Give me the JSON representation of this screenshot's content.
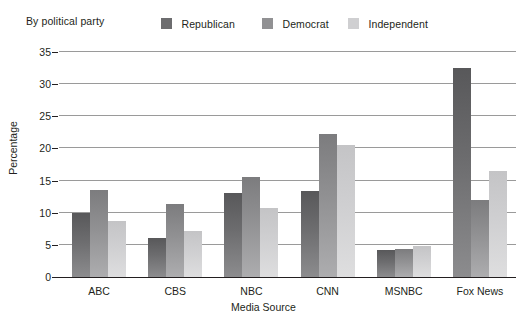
{
  "legend": {
    "title": "By political party",
    "items": [
      {
        "label": "Republican",
        "color": "#6d6d6f"
      },
      {
        "label": "Democrat",
        "color": "#919193"
      },
      {
        "label": "Independent",
        "color": "#cfcfd1"
      }
    ]
  },
  "axes": {
    "ylabel": "Percentage",
    "xlabel": "Media Source",
    "yticks": [
      "35",
      "30",
      "25",
      "20",
      "15",
      "10",
      "5",
      "0"
    ]
  },
  "chart_data": {
    "type": "bar",
    "title": "",
    "subtitle": "",
    "legend_title": "By political party",
    "legend_position": "top",
    "grid": true,
    "xlabel": "Media Source",
    "ylabel": "Percentage",
    "ylim": [
      0,
      35
    ],
    "ytick_values": [
      0,
      5,
      10,
      15,
      20,
      25,
      30,
      35
    ],
    "categories": [
      "ABC",
      "CBS",
      "NBC",
      "CNN",
      "MSNBC",
      "Fox News"
    ],
    "series": [
      {
        "name": "Republican",
        "color": "#6d6d6f",
        "values": [
          10.0,
          6.0,
          13.0,
          13.4,
          4.2,
          32.5
        ]
      },
      {
        "name": "Democrat",
        "color": "#919193",
        "values": [
          13.5,
          11.3,
          15.6,
          22.3,
          4.4,
          12.0
        ]
      },
      {
        "name": "Independent",
        "color": "#cfcfd1",
        "values": [
          8.7,
          7.2,
          10.7,
          20.5,
          4.9,
          16.5
        ]
      }
    ]
  }
}
